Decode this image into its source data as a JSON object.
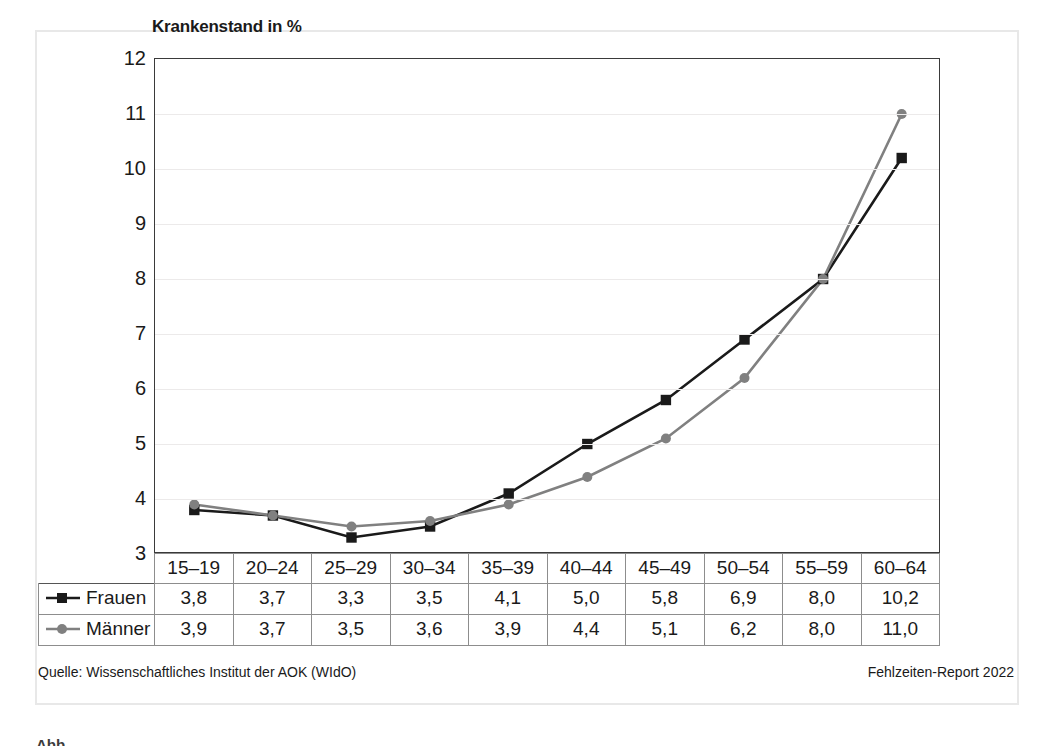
{
  "chart_data": {
    "type": "line",
    "title": "Krankenstand in %",
    "xlabel": "",
    "ylabel": "",
    "categories": [
      "15–19",
      "20–24",
      "25–29",
      "30–34",
      "35–39",
      "40–44",
      "45–49",
      "50–54",
      "55–59",
      "60–64"
    ],
    "series": [
      {
        "name": "Frauen",
        "marker": "square",
        "color": "#1a1a1a",
        "values": [
          3.8,
          3.7,
          3.3,
          3.5,
          4.1,
          5.0,
          5.8,
          6.9,
          8.0,
          10.2
        ],
        "labels": [
          "3,8",
          "3,7",
          "3,3",
          "3,5",
          "4,1",
          "5,0",
          "5,8",
          "6,9",
          "8,0",
          "10,2"
        ]
      },
      {
        "name": "Männer",
        "marker": "circle",
        "color": "#808080",
        "values": [
          3.9,
          3.7,
          3.5,
          3.6,
          3.9,
          4.4,
          5.1,
          6.2,
          8.0,
          11.0
        ],
        "labels": [
          "3,9",
          "3,7",
          "3,5",
          "3,6",
          "3,9",
          "4,4",
          "5,1",
          "6,2",
          "8,0",
          "11,0"
        ]
      }
    ],
    "ylim": [
      3,
      12
    ],
    "yticks": [
      3,
      4,
      5,
      6,
      7,
      8,
      9,
      10,
      11,
      12
    ],
    "ytick_labels": [
      "3",
      "4",
      "5",
      "6",
      "7",
      "8",
      "9",
      "10",
      "11",
      "12"
    ],
    "grid": true,
    "legend_position": "table-row-labels"
  },
  "footer": {
    "source": "Quelle: Wissenschaftliches Institut der AOK (WIdO)",
    "report": "Fehlzeiten-Report 2022"
  },
  "caption_stub": "Abb."
}
